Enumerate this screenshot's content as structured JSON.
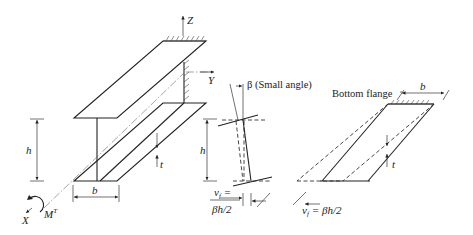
{
  "diagram": {
    "left_beam": {
      "axes": {
        "z": "Z",
        "y": "Y",
        "x": "X"
      },
      "torque_label": "M",
      "torque_superscript": "T",
      "height_label": "h",
      "width_label": "b",
      "thickness_label": "t"
    },
    "middle_section": {
      "angle_label": "β (Small angle)",
      "height_label": "h",
      "displacement_label_line1": "v",
      "displacement_sub": "f",
      "displacement_eq": "=",
      "displacement_label_line2": "βh/2"
    },
    "right_flange": {
      "title": "Bottom flange",
      "width_label": "b",
      "thickness_label": "t",
      "displacement_label": "v",
      "displacement_sub": "f",
      "displacement_eq": "= βh/2"
    },
    "colors": {
      "line": "#222222",
      "background": "#ffffff"
    }
  }
}
